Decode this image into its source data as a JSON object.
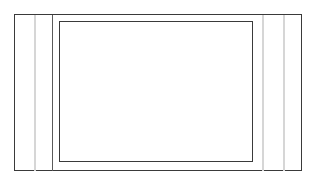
{
  "drawing": {
    "title": "Rectangular Frame Elevation",
    "type": "line-drawing",
    "canvas": {
      "width": 317,
      "height": 185,
      "background_color": "#ffffff"
    },
    "palette": {
      "stroke_dark": "#3a3a3a",
      "stroke_medium": "#5a5a5a",
      "stroke_light": "#d6d6d6",
      "fill_white": "#ffffff"
    },
    "outer_frame": {
      "label": "outer-frame",
      "x": 14.5,
      "y": 14.5,
      "width": 287,
      "height": 156,
      "stroke_color": "#3a3a3a",
      "stroke_width": 1,
      "fill": "#ffffff"
    },
    "inner_rect": {
      "label": "inner-rectangle",
      "x": 59.5,
      "y": 21.5,
      "width": 193,
      "height": 140,
      "stroke_color": "#3a3a3a",
      "stroke_width": 1,
      "fill": "#ffffff"
    },
    "vertical_lines": [
      {
        "label": "left-light-divider",
        "x": 34.5,
        "y1": 14.5,
        "y2": 170.5,
        "stroke_color": "#d6d6d6",
        "stroke_width": 2
      },
      {
        "label": "left-dark-divider",
        "x": 52.5,
        "y1": 14.5,
        "y2": 170.5,
        "stroke_color": "#5a5a5a",
        "stroke_width": 1
      },
      {
        "label": "right-inner-light-divider",
        "x": 262.5,
        "y1": 14.5,
        "y2": 170.5,
        "stroke_color": "#d6d6d6",
        "stroke_width": 2
      },
      {
        "label": "right-outer-light-divider",
        "x": 283.5,
        "y1": 14.5,
        "y2": 170.5,
        "stroke_color": "#d6d6d6",
        "stroke_width": 2
      }
    ]
  }
}
